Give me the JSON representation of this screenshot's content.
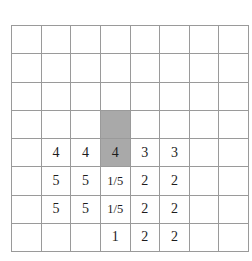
{
  "figure": {
    "type": "grid-table-diagram",
    "columns": 8,
    "rows": 8,
    "background_color": "#ffffff",
    "grid_line_color": "#9a9a9a",
    "shaded_cell_color": "#a9a9a9",
    "text_color": "#1d1d1d"
  },
  "grid": {
    "cells": [
      [
        {
          "text": "",
          "shaded": false
        },
        {
          "text": "",
          "shaded": false
        },
        {
          "text": "",
          "shaded": false
        },
        {
          "text": "",
          "shaded": false
        },
        {
          "text": "",
          "shaded": false
        },
        {
          "text": "",
          "shaded": false
        },
        {
          "text": "",
          "shaded": false
        },
        {
          "text": "",
          "shaded": false
        }
      ],
      [
        {
          "text": "",
          "shaded": false
        },
        {
          "text": "",
          "shaded": false
        },
        {
          "text": "",
          "shaded": false
        },
        {
          "text": "",
          "shaded": false
        },
        {
          "text": "",
          "shaded": false
        },
        {
          "text": "",
          "shaded": false
        },
        {
          "text": "",
          "shaded": false
        },
        {
          "text": "",
          "shaded": false
        }
      ],
      [
        {
          "text": "",
          "shaded": false
        },
        {
          "text": "",
          "shaded": false
        },
        {
          "text": "",
          "shaded": false
        },
        {
          "text": "",
          "shaded": false
        },
        {
          "text": "",
          "shaded": false
        },
        {
          "text": "",
          "shaded": false
        },
        {
          "text": "",
          "shaded": false
        },
        {
          "text": "",
          "shaded": false
        }
      ],
      [
        {
          "text": "",
          "shaded": false
        },
        {
          "text": "",
          "shaded": false
        },
        {
          "text": "",
          "shaded": false
        },
        {
          "text": "",
          "shaded": true
        },
        {
          "text": "",
          "shaded": false
        },
        {
          "text": "",
          "shaded": false
        },
        {
          "text": "",
          "shaded": false
        },
        {
          "text": "",
          "shaded": false
        }
      ],
      [
        {
          "text": "",
          "shaded": false
        },
        {
          "text": "4",
          "shaded": false
        },
        {
          "text": "4",
          "shaded": false
        },
        {
          "text": "4",
          "shaded": true
        },
        {
          "text": "3",
          "shaded": false
        },
        {
          "text": "3",
          "shaded": false
        },
        {
          "text": "",
          "shaded": false
        },
        {
          "text": "",
          "shaded": false
        }
      ],
      [
        {
          "text": "",
          "shaded": false
        },
        {
          "text": "5",
          "shaded": false
        },
        {
          "text": "5",
          "shaded": false
        },
        {
          "text": "1/5",
          "shaded": false
        },
        {
          "text": "2",
          "shaded": false
        },
        {
          "text": "2",
          "shaded": false
        },
        {
          "text": "",
          "shaded": false
        },
        {
          "text": "",
          "shaded": false
        }
      ],
      [
        {
          "text": "",
          "shaded": false
        },
        {
          "text": "5",
          "shaded": false
        },
        {
          "text": "5",
          "shaded": false
        },
        {
          "text": "1/5",
          "shaded": false
        },
        {
          "text": "2",
          "shaded": false
        },
        {
          "text": "2",
          "shaded": false
        },
        {
          "text": "",
          "shaded": false
        },
        {
          "text": "",
          "shaded": false
        }
      ],
      [
        {
          "text": "",
          "shaded": false
        },
        {
          "text": "",
          "shaded": false
        },
        {
          "text": "",
          "shaded": false
        },
        {
          "text": "1",
          "shaded": false
        },
        {
          "text": "2",
          "shaded": false
        },
        {
          "text": "2",
          "shaded": false
        },
        {
          "text": "",
          "shaded": false
        },
        {
          "text": "",
          "shaded": false
        }
      ]
    ]
  }
}
